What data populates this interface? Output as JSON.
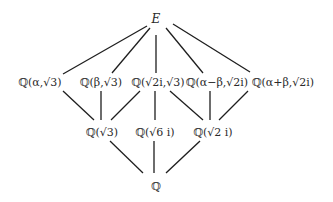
{
  "diagram": {
    "type": "field-extension-lattice",
    "nodes": {
      "top": {
        "label": "E",
        "x": 156,
        "y": 19
      },
      "l1_a": {
        "label": "ℚ(α,√3)",
        "x": 40,
        "y": 82
      },
      "l1_b": {
        "label": "ℚ(β,√3)",
        "x": 101,
        "y": 82
      },
      "l1_c": {
        "label": "ℚ(√2i,√3)",
        "x": 158,
        "y": 82
      },
      "l1_d": {
        "label": "ℚ(α−β,√2i)",
        "x": 217,
        "y": 82
      },
      "l1_e": {
        "label": "ℚ(α+β,√2i)",
        "x": 283,
        "y": 82
      },
      "l2_a": {
        "label": "ℚ(√3)",
        "x": 102,
        "y": 132
      },
      "l2_b": {
        "label": "ℚ(√6 i)",
        "x": 155,
        "y": 132
      },
      "l2_c": {
        "label": "ℚ(√2 i)",
        "x": 213,
        "y": 132
      },
      "bottom": {
        "label": "ℚ",
        "x": 156,
        "y": 186
      }
    },
    "edges": [
      {
        "from": "top",
        "to": "l1_a"
      },
      {
        "from": "top",
        "to": "l1_b"
      },
      {
        "from": "top",
        "to": "l1_c"
      },
      {
        "from": "top",
        "to": "l1_d"
      },
      {
        "from": "top",
        "to": "l1_e"
      },
      {
        "from": "l1_a",
        "to": "l2_a"
      },
      {
        "from": "l1_b",
        "to": "l2_a"
      },
      {
        "from": "l1_c",
        "to": "l2_a"
      },
      {
        "from": "l1_c",
        "to": "l2_b"
      },
      {
        "from": "l1_c",
        "to": "l2_c"
      },
      {
        "from": "l1_d",
        "to": "l2_c"
      },
      {
        "from": "l1_e",
        "to": "l2_c"
      },
      {
        "from": "l2_a",
        "to": "bottom"
      },
      {
        "from": "l2_b",
        "to": "bottom"
      },
      {
        "from": "l2_c",
        "to": "bottom"
      }
    ]
  }
}
